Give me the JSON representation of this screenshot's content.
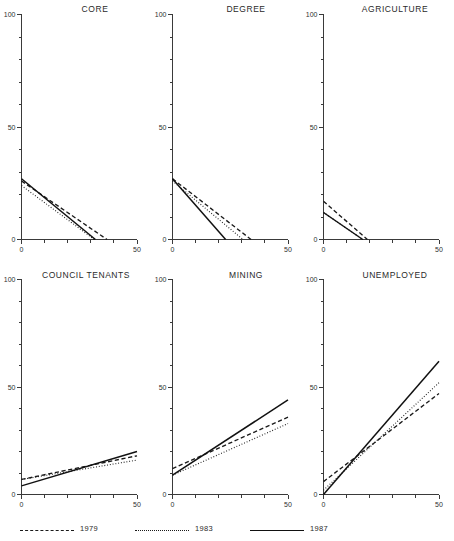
{
  "figure": {
    "width": 454,
    "height": 541,
    "background": "#ffffff",
    "ink_color": "#1a1a1a"
  },
  "legend": {
    "position": "bottom-left",
    "items": [
      {
        "label": "1979",
        "style": "dashed",
        "name": "legend-item-1979"
      },
      {
        "label": "1983",
        "style": "dotted",
        "name": "legend-item-1983"
      },
      {
        "label": "1987",
        "style": "solid",
        "name": "legend-item-1987"
      }
    ]
  },
  "axes_common": {
    "xlim": [
      0,
      50
    ],
    "ylim": [
      0,
      100
    ],
    "xticks": [
      0,
      50
    ],
    "yticks": [
      0,
      50,
      100
    ],
    "xtick_labels": [
      "0",
      "50"
    ],
    "ytick_labels": [
      "0",
      "50",
      "100"
    ],
    "x_minor_ticks": [
      10,
      20,
      30,
      40
    ],
    "y_minor_ticks": [
      10,
      20,
      30,
      40,
      60,
      70,
      80,
      90
    ],
    "grid": false,
    "xlabel": "",
    "ylabel": ""
  },
  "chart_data": [
    {
      "type": "line",
      "title": "CORE",
      "panel": 1,
      "xlabel": "",
      "ylabel": "",
      "xlim": [
        0,
        50
      ],
      "ylim": [
        0,
        100
      ],
      "x": [
        0,
        50
      ],
      "series": [
        {
          "name": "1979",
          "style": "dashed",
          "x": [
            0,
            37
          ],
          "values": [
            26,
            0
          ]
        },
        {
          "name": "1983",
          "style": "dotted",
          "x": [
            0,
            31.5
          ],
          "values": [
            24,
            0
          ]
        },
        {
          "name": "1987",
          "style": "solid",
          "x": [
            0,
            32
          ],
          "values": [
            27,
            0
          ]
        }
      ]
    },
    {
      "type": "line",
      "title": "DEGREE",
      "panel": 2,
      "xlabel": "",
      "ylabel": "",
      "xlim": [
        0,
        50
      ],
      "ylim": [
        0,
        100
      ],
      "x": [
        0,
        50
      ],
      "series": [
        {
          "name": "1979",
          "style": "dashed",
          "x": [
            0,
            34
          ],
          "values": [
            27,
            0
          ]
        },
        {
          "name": "1983",
          "style": "dotted",
          "x": [
            0,
            30.5
          ],
          "values": [
            26,
            0
          ]
        },
        {
          "name": "1987",
          "style": "solid",
          "x": [
            0,
            23
          ],
          "values": [
            27,
            0
          ]
        }
      ]
    },
    {
      "type": "line",
      "title": "AGRICULTURE",
      "panel": 3,
      "xlabel": "",
      "ylabel": "",
      "xlim": [
        0,
        50
      ],
      "ylim": [
        0,
        100
      ],
      "x": [
        0,
        50
      ],
      "series": [
        {
          "name": "1979",
          "style": "dashed",
          "x": [
            0,
            19
          ],
          "values": [
            17,
            0
          ]
        },
        {
          "name": "1983",
          "style": "dotted",
          "x": [
            0,
            17
          ],
          "values": [
            12,
            0
          ]
        },
        {
          "name": "1987",
          "style": "solid",
          "x": [
            0,
            17
          ],
          "values": [
            12,
            0
          ]
        }
      ]
    },
    {
      "type": "line",
      "title": "COUNCIL TENANTS",
      "panel": 4,
      "xlabel": "",
      "ylabel": "",
      "xlim": [
        0,
        50
      ],
      "ylim": [
        0,
        100
      ],
      "x": [
        0,
        50
      ],
      "series": [
        {
          "name": "1979",
          "style": "dashed",
          "x": [
            0,
            50
          ],
          "values": [
            7,
            18
          ]
        },
        {
          "name": "1983",
          "style": "dotted",
          "x": [
            0,
            50
          ],
          "values": [
            7,
            16
          ]
        },
        {
          "name": "1987",
          "style": "solid",
          "x": [
            0,
            50
          ],
          "values": [
            4,
            20
          ]
        }
      ]
    },
    {
      "type": "line",
      "title": "MINING",
      "panel": 5,
      "xlabel": "",
      "ylabel": "",
      "xlim": [
        0,
        50
      ],
      "ylim": [
        0,
        100
      ],
      "x": [
        0,
        50
      ],
      "series": [
        {
          "name": "1979",
          "style": "dashed",
          "x": [
            0,
            50
          ],
          "values": [
            12,
            36
          ]
        },
        {
          "name": "1983",
          "style": "dotted",
          "x": [
            0,
            50
          ],
          "values": [
            9,
            33
          ]
        },
        {
          "name": "1987",
          "style": "solid",
          "x": [
            0,
            50
          ],
          "values": [
            9,
            44
          ]
        }
      ]
    },
    {
      "type": "line",
      "title": "UNEMPLOYED",
      "panel": 6,
      "xlabel": "",
      "ylabel": "",
      "xlim": [
        0,
        50
      ],
      "ylim": [
        0,
        100
      ],
      "x": [
        0,
        50
      ],
      "series": [
        {
          "name": "1979",
          "style": "dashed",
          "x": [
            0,
            50
          ],
          "values": [
            6,
            47
          ]
        },
        {
          "name": "1983",
          "style": "dotted",
          "x": [
            0,
            50
          ],
          "values": [
            2,
            52
          ]
        },
        {
          "name": "1987",
          "style": "solid",
          "x": [
            0,
            50
          ],
          "values": [
            0,
            62
          ]
        }
      ]
    }
  ]
}
